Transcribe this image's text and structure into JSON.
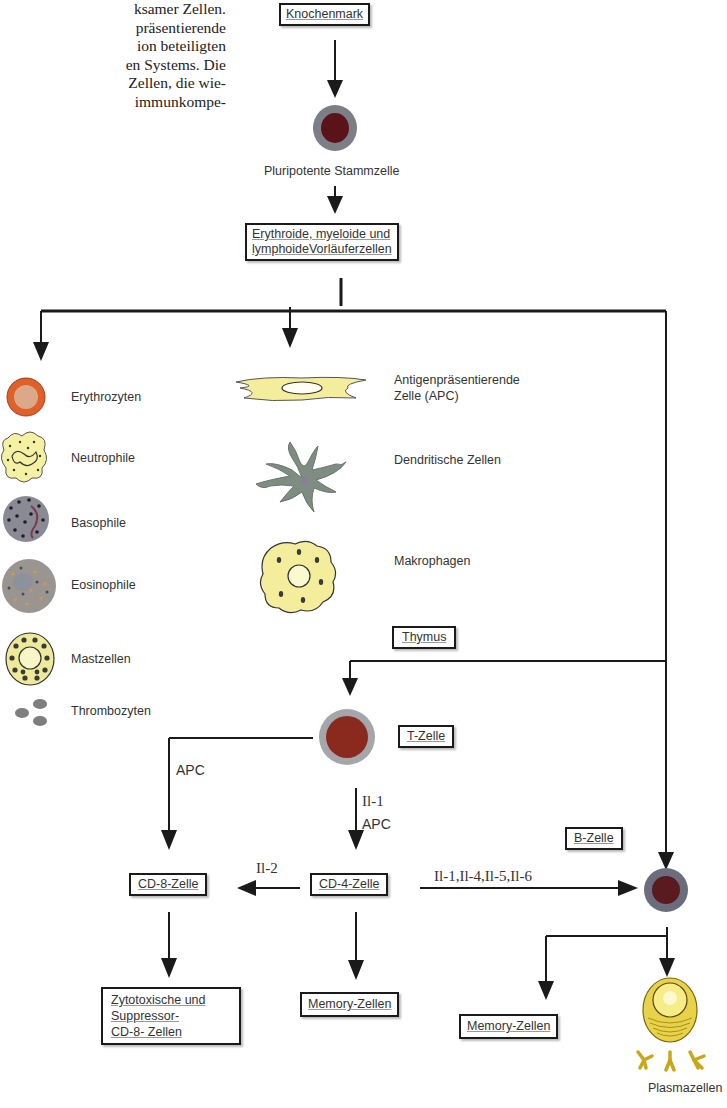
{
  "intro_text": {
    "lines": [
      "ksamer Zellen.",
      "präsentierende",
      "ion beteiligten",
      "en Systems. Die",
      "Zellen, die wie-",
      "immunkompe-"
    ]
  },
  "flow": {
    "bone_marrow": "Knochenmark",
    "stem_cell": "Pluripotente Stammzelle",
    "progenitors_line1": "Erythroide, myeloide und",
    "progenitors_line2": "lymphoideVorläuferzellen",
    "thymus": "Thymus",
    "t_cell": "T-Zelle",
    "b_cell": "B-Zelle",
    "cd8_cell": "CD-8-Zelle",
    "cd4_cell": "CD-4-Zelle",
    "cytotoxic_line1": "Zytotoxische und",
    "cytotoxic_line2": "Suppressor-",
    "cytotoxic_line3": "CD-8- Zellen",
    "memory_t": "Memory-Zellen",
    "memory_b": "Memory-Zellen",
    "plasma": "Plasmazellen"
  },
  "edge_labels": {
    "apc_to_cd8": "APC",
    "t_to_cd4_line1": "Il-1",
    "t_to_cd4_line2": "APC",
    "cd4_to_cd8": "Il-2",
    "cd4_to_b": "Il-1,Il-4,Il-5,Il-6"
  },
  "myeloid_cells": [
    {
      "name": "Erythrozyten",
      "icon": "erythrocyte-icon"
    },
    {
      "name": "Neutrophile",
      "icon": "neutrophil-icon"
    },
    {
      "name": "Basophile",
      "icon": "basophil-icon"
    },
    {
      "name": "Eosinophile",
      "icon": "eosinophil-icon"
    },
    {
      "name": "Mastzellen",
      "icon": "mast-cell-icon"
    },
    {
      "name": "Thrombozyten",
      "icon": "thrombocyte-icon"
    }
  ],
  "apc_cells": [
    {
      "name_line1": "Antigenpräsentierende",
      "name_line2": "Zelle (APC)",
      "icon": "apc-icon"
    },
    {
      "name_line1": "Dendritische Zellen",
      "icon": "dendritic-cell-icon"
    },
    {
      "name_line1": "Makrophagen",
      "icon": "macrophage-icon"
    }
  ],
  "colors": {
    "line": "#1a1a1a",
    "cell_nucleus_red": "#7a1a1a",
    "cell_membrane_gray": "#8a8d94",
    "erythrocyte_orange": "#e0602a",
    "yellow_cytoplasm": "#f5f0a0",
    "dendritic_green_gray": "#7f8c82"
  }
}
